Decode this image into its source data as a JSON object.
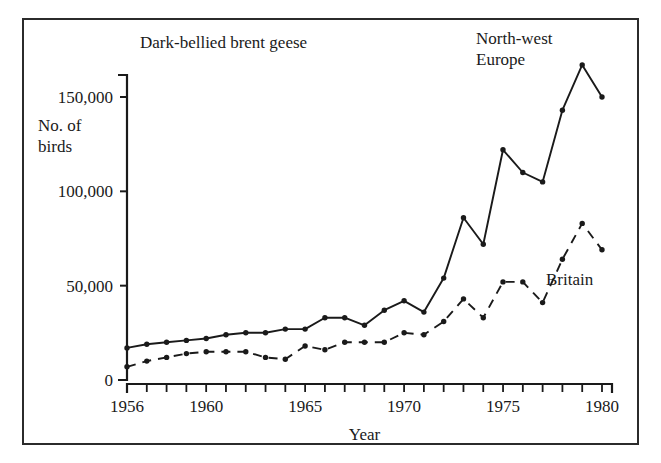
{
  "chart_data": {
    "type": "line",
    "title": "Dark-bellied brent geese",
    "xlabel": "Year",
    "ylabel": "No. of\nbirds",
    "ylabel_line1": "No. of",
    "ylabel_line2": "birds",
    "xlim": [
      1956,
      1980
    ],
    "ylim": [
      0,
      175000
    ],
    "grid": false,
    "legend_position": "inline-annotations",
    "x": [
      1956,
      1957,
      1958,
      1959,
      1960,
      1961,
      1962,
      1963,
      1964,
      1965,
      1966,
      1967,
      1968,
      1969,
      1970,
      1971,
      1972,
      1973,
      1974,
      1975,
      1976,
      1977,
      1978,
      1979,
      1980
    ],
    "xticks": [
      1956,
      1960,
      1965,
      1970,
      1975,
      1980
    ],
    "xtick_labels": [
      "1956",
      "1960",
      "1965",
      "1970",
      "1975",
      "1980"
    ],
    "yticks": [
      0,
      50000,
      100000,
      150000
    ],
    "ytick_labels": [
      "0",
      "50,000",
      "100,000",
      "150,000"
    ],
    "series": [
      {
        "name": "North-west Europe",
        "style": "solid",
        "marker": "dot",
        "color": "#1a1a1a",
        "annotation_line1": "North-west",
        "annotation_line2": "Europe",
        "values": [
          17000,
          19000,
          20000,
          21000,
          22000,
          24000,
          25000,
          25000,
          27000,
          27000,
          33000,
          33000,
          29000,
          37000,
          42000,
          36000,
          54000,
          86000,
          72000,
          122000,
          110000,
          105000,
          143000,
          167000,
          150000
        ]
      },
      {
        "name": "Britain",
        "style": "dashed",
        "marker": "dot",
        "color": "#1a1a1a",
        "annotation_line1": "Britain",
        "values": [
          7000,
          10000,
          12000,
          14000,
          15000,
          15000,
          15000,
          12000,
          11000,
          18000,
          16000,
          20000,
          20000,
          20000,
          25000,
          24000,
          31000,
          43000,
          33000,
          52000,
          52000,
          41000,
          64000,
          83000,
          69000
        ]
      }
    ]
  }
}
